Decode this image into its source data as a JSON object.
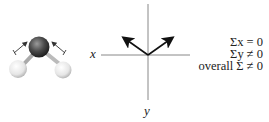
{
  "diagram": {
    "molecule": {
      "name": "bent molecule (water-like)",
      "central_atom_color": "#4a4a4a",
      "outer_atom_color": "#eeeeee",
      "dipole_arrows": 2
    },
    "axes": {
      "x_label": "x",
      "y_label": "y",
      "vectors": [
        "up-left",
        "up-right"
      ]
    },
    "equations": [
      "Σx = 0",
      "Σy ≠ 0",
      "overall Σ ≠ 0"
    ]
  }
}
